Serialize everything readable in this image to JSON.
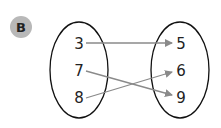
{
  "badge": {
    "label": "B",
    "color": "#b8b8b8"
  },
  "domain_set": {
    "values": [
      "3",
      "7",
      "8"
    ]
  },
  "range_set": {
    "values": [
      "5",
      "6",
      "9"
    ]
  },
  "mappings": [
    {
      "from": "3",
      "to": "5"
    },
    {
      "from": "7",
      "to": "9"
    },
    {
      "from": "8",
      "to": "6"
    }
  ],
  "colors": {
    "arrow": "#8a8a8a",
    "ellipse": "#111111",
    "text": "#222222"
  }
}
